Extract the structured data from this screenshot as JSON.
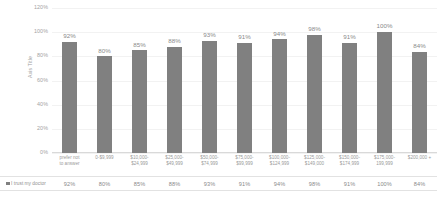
{
  "chart_data": {
    "type": "bar",
    "title": "",
    "xlabel": "",
    "ylabel": "Axis Title",
    "ylim": [
      0,
      120
    ],
    "yticks": [
      "0%",
      "20%",
      "40%",
      "60%",
      "80%",
      "100%",
      "120%"
    ],
    "grid": true,
    "legend_position": "bottom-table",
    "bar_color": "#808080",
    "categories": [
      "prefer not to answer",
      "0-$9,999",
      "$10,000-$24,999",
      "$25,000-$49,999",
      "$50,000-$74,999",
      "$75,000-$99,999",
      "$100,000-$124,999",
      "$125,000-$149,000",
      "$150,000-$174,999",
      "$175,000-199,999",
      "$200,000 +"
    ],
    "category_lines": [
      [
        "prefer not",
        "to answer"
      ],
      [
        "0-$9,999",
        ""
      ],
      [
        "$10,000-",
        "$24,999"
      ],
      [
        "$25,000-",
        "$49,999"
      ],
      [
        "$50,000-",
        "$74,999"
      ],
      [
        "$75,000-",
        "$99,999"
      ],
      [
        "$100,000-",
        "$124,999"
      ],
      [
        "$125,000-",
        "$149,000"
      ],
      [
        "$150,000-",
        "$174,999"
      ],
      [
        "$175,000-",
        "199,999"
      ],
      [
        "$200,000 +",
        ""
      ]
    ],
    "series": [
      {
        "name": "I trust my doctor",
        "values": [
          92,
          80,
          85,
          88,
          93,
          91,
          94,
          98,
          91,
          100,
          84
        ],
        "labels": [
          "92%",
          "80%",
          "85%",
          "88%",
          "93%",
          "91%",
          "94%",
          "98%",
          "91%",
          "100%",
          "84%"
        ]
      }
    ]
  },
  "legend": {
    "marker": "square-marker-icon",
    "label": "I trust my doctor"
  }
}
